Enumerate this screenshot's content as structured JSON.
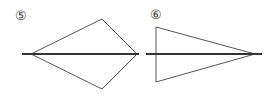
{
  "figures": [
    {
      "label": "⑤",
      "shape": "kite",
      "axis": {
        "x1": 22,
        "y1": 54,
        "x2": 139,
        "y2": 54
      },
      "points": "31,54 102,19 137,54 102,89"
    },
    {
      "label": "⑥",
      "shape": "isosceles-triangle",
      "axis": {
        "x1": 146,
        "y1": 54,
        "x2": 262,
        "y2": 54
      },
      "points": "156,27 156,82 255,54"
    }
  ],
  "colors": {
    "stroke": "#555555",
    "axis": "#333333"
  }
}
